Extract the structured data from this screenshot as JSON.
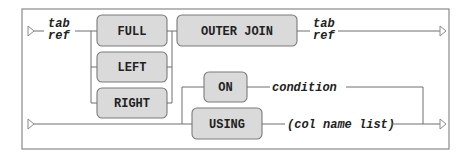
{
  "diagram": {
    "type": "syntax-railroad",
    "row1": {
      "start_label_line1": "tab",
      "start_label_line2": "ref",
      "join_types": [
        "FULL",
        "LEFT",
        "RIGHT"
      ],
      "outer_join": "OUTER JOIN",
      "end_label_line1": "tab",
      "end_label_line2": "ref"
    },
    "row2": {
      "on_keyword": "ON",
      "on_argument": "condition",
      "using_keyword": "USING",
      "using_argument": "(col name list)"
    }
  }
}
